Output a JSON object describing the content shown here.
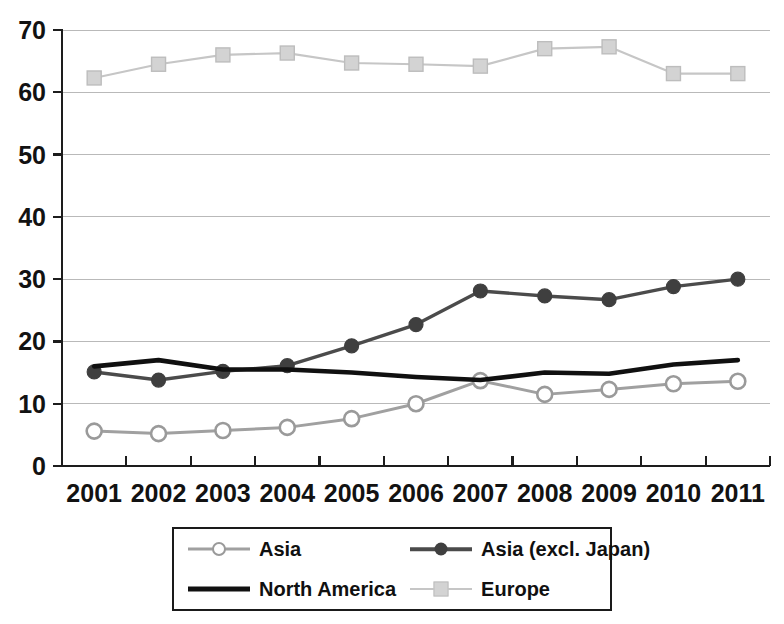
{
  "chart_data": {
    "type": "line",
    "title": "",
    "subtitle": "",
    "xlabel": "",
    "ylabel": "",
    "categories": [
      "2001",
      "2002",
      "2003",
      "2004",
      "2005",
      "2006",
      "2007",
      "2008",
      "2009",
      "2010",
      "2011"
    ],
    "x_tick_labels": [
      "2001",
      "2002",
      "2003",
      "2004",
      "2005",
      "2006",
      "2007",
      "2008",
      "2009",
      "2010",
      "2011"
    ],
    "y_tick_labels": [
      "0",
      "10",
      "20",
      "30",
      "40",
      "50",
      "60",
      "70"
    ],
    "y_ticks": [
      0,
      10,
      20,
      30,
      40,
      50,
      60,
      70
    ],
    "ylim": [
      0,
      70
    ],
    "grid": "horizontal",
    "legend_position": "bottom",
    "series": [
      {
        "name": "Asia",
        "color": "#a0a0a0",
        "marker": "circle-open",
        "values": [
          5.6,
          5.2,
          5.7,
          6.2,
          7.6,
          10.0,
          13.7,
          11.5,
          12.3,
          13.2,
          13.6
        ]
      },
      {
        "name": "Asia (excl. Japan)",
        "color": "#4b4b4b",
        "marker": "circle-filled",
        "values": [
          15.1,
          13.8,
          15.2,
          16.1,
          19.3,
          22.7,
          28.1,
          27.3,
          26.7,
          28.8,
          30.0
        ]
      },
      {
        "name": "North America",
        "color": "#101010",
        "marker": "none",
        "values": [
          16.0,
          17.0,
          15.5,
          15.5,
          15.0,
          14.3,
          13.8,
          15.0,
          14.8,
          16.3,
          17.0
        ]
      },
      {
        "name": "Europe",
        "color": "#c6c6c6",
        "marker": "square",
        "values": [
          62.3,
          64.5,
          66.0,
          66.3,
          64.7,
          64.5,
          64.2,
          67.0,
          67.3,
          63.0,
          63.0
        ]
      }
    ]
  },
  "legend": {
    "entries": [
      {
        "label": "Asia"
      },
      {
        "label": "Asia (excl. Japan)"
      },
      {
        "label": "North America"
      },
      {
        "label": "Europe"
      }
    ]
  },
  "colors": {
    "axis": "#1d1d1d",
    "grid": "#b9b9b9",
    "background": "#ffffff"
  }
}
